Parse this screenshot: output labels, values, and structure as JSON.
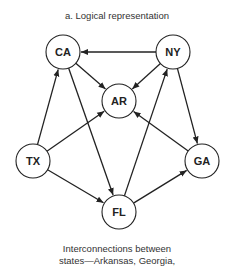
{
  "title": "a. Logical representation",
  "nodes": [
    {
      "id": "CA",
      "label": "CA",
      "x": 63,
      "y": 52
    },
    {
      "id": "NY",
      "label": "NY",
      "x": 173,
      "y": 52
    },
    {
      "id": "AR",
      "label": "AR",
      "x": 119,
      "y": 101
    },
    {
      "id": "TX",
      "label": "TX",
      "x": 33,
      "y": 161
    },
    {
      "id": "GA",
      "label": "GA",
      "x": 202,
      "y": 161
    },
    {
      "id": "FL",
      "label": "FL",
      "x": 119,
      "y": 212
    }
  ],
  "edges": [
    {
      "from": "NY",
      "to": "CA"
    },
    {
      "from": "CA",
      "to": "AR"
    },
    {
      "from": "NY",
      "to": "AR"
    },
    {
      "from": "FL",
      "to": "NY"
    },
    {
      "from": "NY",
      "to": "GA"
    },
    {
      "from": "GA",
      "to": "AR"
    },
    {
      "from": "TX",
      "to": "AR"
    },
    {
      "from": "TX",
      "to": "CA"
    },
    {
      "from": "CA",
      "to": "FL"
    },
    {
      "from": "TX",
      "to": "FL"
    },
    {
      "from": "FL",
      "to": "GA"
    }
  ],
  "caption": {
    "line1": "Interconnections between",
    "line2": "states—Arkansas, Georgia,"
  }
}
